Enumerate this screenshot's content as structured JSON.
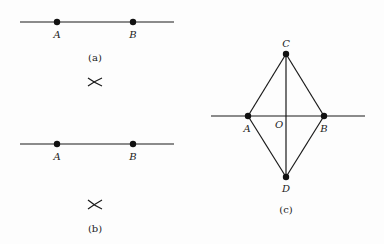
{
  "figure": {
    "panels": [
      {
        "id": "a",
        "caption": "(a)",
        "points": [
          {
            "label": "A",
            "x": 57,
            "y": 22
          },
          {
            "label": "B",
            "x": 133,
            "y": 22
          }
        ],
        "line": {
          "x1": 20,
          "y1": 22,
          "x2": 174,
          "y2": 22
        },
        "arc_mark": {
          "x": 95,
          "y": 82,
          "symbol": "×"
        }
      },
      {
        "id": "b",
        "caption": "(b)",
        "points": [
          {
            "label": "A",
            "x": 57,
            "y": 144
          },
          {
            "label": "B",
            "x": 133,
            "y": 144
          }
        ],
        "line": {
          "x1": 20,
          "y1": 144,
          "x2": 174,
          "y2": 144
        },
        "arc_mark": {
          "x": 95,
          "y": 205,
          "symbol": "×"
        }
      },
      {
        "id": "c",
        "caption": "(c)",
        "points": [
          {
            "label": "A",
            "x": 248,
            "y": 116
          },
          {
            "label": "B",
            "x": 324,
            "y": 116
          },
          {
            "label": "C",
            "x": 286,
            "y": 54
          },
          {
            "label": "D",
            "x": 286,
            "y": 177
          }
        ],
        "center_label": "O",
        "line": {
          "x1": 211,
          "y1": 116,
          "x2": 365,
          "y2": 116
        },
        "segments": [
          "AC",
          "CB",
          "BD",
          "DA",
          "CD"
        ]
      }
    ]
  }
}
